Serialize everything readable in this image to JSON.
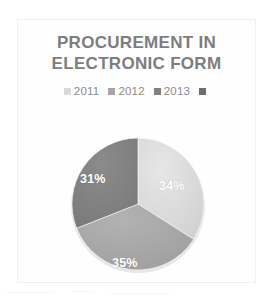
{
  "chart": {
    "title_line1": "PROCUREMENT IN",
    "title_line2": "ELECTRONIC FORM",
    "title_color": "#7d7d7d"
  },
  "chart_data": {
    "type": "pie",
    "title": "PROCUREMENT IN ELECTRONIC FORM",
    "xlabel": "",
    "ylabel": "",
    "legend_position": "top",
    "grid": false,
    "categories": [
      "2011",
      "2012",
      "2013"
    ],
    "values": [
      34,
      35,
      31
    ],
    "data_labels": [
      "34%",
      "35%",
      "31%"
    ],
    "colors": [
      "#d9d9d9",
      "#a6a6a6",
      "#808080"
    ],
    "start_angle_deg": 0,
    "direction": "clockwise",
    "legend": [
      {
        "label": "2011",
        "color": "#d9d9d9"
      },
      {
        "label": "2012",
        "color": "#a6a6a6"
      },
      {
        "label": "2013",
        "color": "#808080"
      },
      {
        "label": "",
        "color": "#6e6e6e"
      }
    ]
  }
}
